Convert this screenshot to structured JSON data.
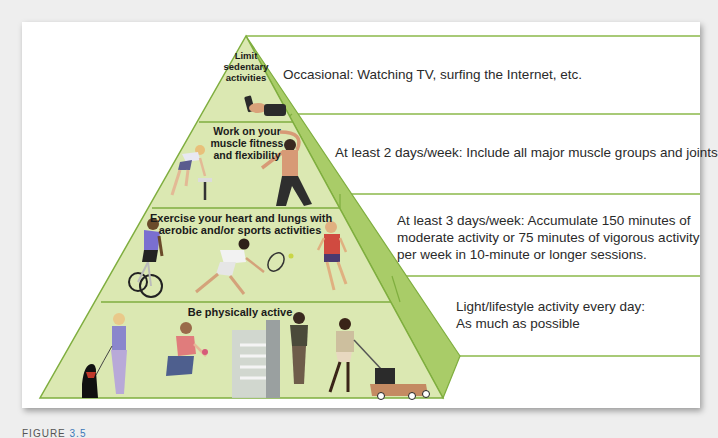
{
  "figure": {
    "caption_prefix": "FIGURE",
    "caption_number": "3.5",
    "colors": {
      "front_face": "#dbe8b0",
      "side_face": "#9cc45a",
      "line": "#7fae3f",
      "background": "#ffffff",
      "page": "#eeeeee"
    },
    "tiers": [
      {
        "label_lines": [
          "Limit",
          "sedentary",
          "activities"
        ],
        "description_lines": [
          "Occasional: Watching TV, surfing the Internet, etc."
        ],
        "illustration": "hand-holding-remote"
      },
      {
        "label_lines": [
          "Work on your",
          "muscle fitness",
          "and flexibility"
        ],
        "description_lines": [
          "At least 2 days/week: Include all major muscle groups and joints"
        ],
        "illustration": "strength-and-stretching-figures"
      },
      {
        "label_lines": [
          "Exercise your heart and lungs with",
          "aerobic and/or sports activities"
        ],
        "description_lines": [
          "At least 3 days/week: Accumulate 150 minutes of",
          "moderate activity or 75 minutes of vigorous activity",
          "per week in 10-minute or longer sessions."
        ],
        "illustration": "cyclist-tennis-runner-figures"
      },
      {
        "label_lines": [
          "Be physically active"
        ],
        "description_lines": [
          "Light/lifestyle activity every day:",
          "As much as possible"
        ],
        "illustration": "dog-walking-gardening-stairs-mowing-figures"
      }
    ]
  }
}
